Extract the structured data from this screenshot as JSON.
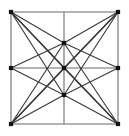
{
  "figure": {
    "type": "graph-diagram",
    "width": 129,
    "height": 136,
    "background_color": "#ffffff"
  },
  "style": {
    "grid_edge_color": "#9a9a9a",
    "grid_edge_width": 1.6,
    "diagonal_edge_color": "#3a3a3a",
    "diagonal_edge_width": 1.15,
    "vertex_color": "#111111",
    "vertex_size": 4.2
  },
  "graph": {
    "vertex_count": 9,
    "vertices": [
      {
        "id": "top-left",
        "label": "TL",
        "x": 11,
        "y": 12
      },
      {
        "id": "top-middle",
        "label": "TM",
        "x": 64,
        "y": 43
      },
      {
        "id": "top-right",
        "label": "TR",
        "x": 118,
        "y": 12
      },
      {
        "id": "left-middle",
        "label": "LM",
        "x": 11,
        "y": 68
      },
      {
        "id": "center",
        "label": "C",
        "x": 64,
        "y": 68
      },
      {
        "id": "right-middle",
        "label": "RM",
        "x": 118,
        "y": 68
      },
      {
        "id": "bottom-left",
        "label": "BL",
        "x": 11,
        "y": 124
      },
      {
        "id": "bottom-middle",
        "label": "BM",
        "x": 64,
        "y": 95
      },
      {
        "id": "bottom-right",
        "label": "BR",
        "x": 118,
        "y": 124
      }
    ],
    "grid_edges": [
      {
        "id": "border-top",
        "x1": 11,
        "y1": 12,
        "x2": 118,
        "y2": 12
      },
      {
        "id": "border-right",
        "x1": 118,
        "y1": 12,
        "x2": 118,
        "y2": 124
      },
      {
        "id": "border-bottom",
        "x1": 11,
        "y1": 124,
        "x2": 118,
        "y2": 124
      },
      {
        "id": "border-left",
        "x1": 11,
        "y1": 12,
        "x2": 11,
        "y2": 124
      },
      {
        "id": "midline-horizontal",
        "x1": 11,
        "y1": 68,
        "x2": 118,
        "y2": 68
      },
      {
        "id": "midline-vertical",
        "x1": 64,
        "y1": 12,
        "x2": 64,
        "y2": 124
      }
    ],
    "diagonal_edges": [
      {
        "id": "tl-tm",
        "from": "top-left",
        "to": "top-middle"
      },
      {
        "id": "tl-c",
        "from": "top-left",
        "to": "center"
      },
      {
        "id": "tl-bm",
        "from": "top-left",
        "to": "bottom-middle"
      },
      {
        "id": "tl-br",
        "from": "top-left",
        "to": "bottom-right"
      },
      {
        "id": "tr-tm",
        "from": "top-right",
        "to": "top-middle"
      },
      {
        "id": "tr-c",
        "from": "top-right",
        "to": "center"
      },
      {
        "id": "tr-bm",
        "from": "top-right",
        "to": "bottom-middle"
      },
      {
        "id": "tr-bl",
        "from": "top-right",
        "to": "bottom-left"
      },
      {
        "id": "bl-tm",
        "from": "bottom-left",
        "to": "top-middle"
      },
      {
        "id": "bl-c",
        "from": "bottom-left",
        "to": "center"
      },
      {
        "id": "bl-bm",
        "from": "bottom-left",
        "to": "bottom-middle"
      },
      {
        "id": "br-tm",
        "from": "bottom-right",
        "to": "top-middle"
      },
      {
        "id": "br-c",
        "from": "bottom-right",
        "to": "center"
      },
      {
        "id": "br-bm",
        "from": "bottom-right",
        "to": "bottom-middle"
      },
      {
        "id": "lm-tm",
        "from": "left-middle",
        "to": "top-middle"
      },
      {
        "id": "lm-bm",
        "from": "left-middle",
        "to": "bottom-middle"
      },
      {
        "id": "rm-tm",
        "from": "right-middle",
        "to": "top-middle"
      },
      {
        "id": "rm-bm",
        "from": "right-middle",
        "to": "bottom-middle"
      }
    ]
  }
}
